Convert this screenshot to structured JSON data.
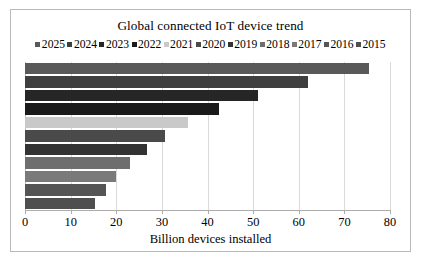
{
  "chart_data": {
    "type": "bar",
    "orientation": "horizontal",
    "title": "Global connected IoT device trend",
    "xlabel": "Billion devices installed",
    "ylabel": "",
    "xlim": [
      0,
      80
    ],
    "xticks": [
      0,
      10,
      20,
      30,
      40,
      50,
      60,
      70,
      80
    ],
    "xtick_labels": [
      "0",
      "10",
      "20",
      "30",
      "40",
      "50",
      "60",
      "70",
      "80"
    ],
    "grid": true,
    "legend_position": "top",
    "categories": [
      "2025",
      "2024",
      "2023",
      "2022",
      "2021",
      "2020",
      "2019",
      "2018",
      "2017",
      "2016",
      "2015"
    ],
    "values": [
      75.4,
      62.0,
      51.1,
      42.6,
      35.8,
      30.7,
      26.7,
      23.1,
      20.0,
      17.7,
      15.4
    ],
    "series": [
      {
        "name": "2025",
        "value": 75.4,
        "color": "#595959"
      },
      {
        "name": "2024",
        "value": 62.0,
        "color": "#3f3f3f"
      },
      {
        "name": "2023",
        "value": 51.1,
        "color": "#262626"
      },
      {
        "name": "2022",
        "value": 42.6,
        "color": "#1a1a1a"
      },
      {
        "name": "2021",
        "value": 35.8,
        "color": "#c9c9c9"
      },
      {
        "name": "2020",
        "value": 30.7,
        "color": "#4a4a4a"
      },
      {
        "name": "2019",
        "value": 26.7,
        "color": "#333333"
      },
      {
        "name": "2018",
        "value": 23.1,
        "color": "#6e6e6e"
      },
      {
        "name": "2017",
        "value": 20.0,
        "color": "#7a7a7a"
      },
      {
        "name": "2016",
        "value": 17.7,
        "color": "#555555"
      },
      {
        "name": "2015",
        "value": 15.4,
        "color": "#4f4f4f"
      }
    ]
  },
  "colors": {
    "frame_border": "#b9b9b9",
    "gridline": "#d9d9d9",
    "axis_line": "#adadad",
    "text": "#000000",
    "background": "#ffffff"
  }
}
